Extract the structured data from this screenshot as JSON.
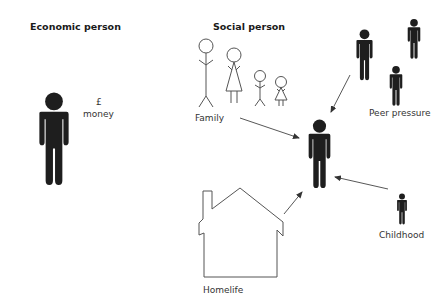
{
  "left": {
    "title": "Economic person",
    "currency_symbol": "£",
    "money_label": "money"
  },
  "right": {
    "title": "Social person",
    "influences": {
      "family": "Family",
      "peer_pressure": "Peer pressure",
      "childhood": "Childhood",
      "homelife": "Homelife"
    }
  },
  "colors": {
    "figure": "#1e1e1e",
    "line": "#555555",
    "text": "#333333"
  }
}
